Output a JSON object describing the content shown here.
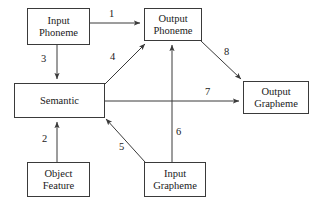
{
  "diagram": {
    "canvas": {
      "width": 325,
      "height": 204,
      "background": "#ffffff"
    },
    "stroke_color": "#3a3a3a",
    "text_color": "#1a1a1a",
    "nodes": [
      {
        "id": "input-phoneme",
        "line1": "Input",
        "line2": "Phoneme",
        "x": 27,
        "y": 8,
        "w": 63,
        "h": 37
      },
      {
        "id": "output-phoneme",
        "line1": "Output",
        "line2": "Phoneme",
        "x": 144,
        "y": 8,
        "w": 58,
        "h": 33
      },
      {
        "id": "semantic",
        "line1": "Semantic",
        "line2": "",
        "x": 14,
        "y": 83,
        "w": 91,
        "h": 35
      },
      {
        "id": "output-grapheme",
        "line1": "Output",
        "line2": "Grapheme",
        "x": 243,
        "y": 81,
        "w": 66,
        "h": 33
      },
      {
        "id": "object-feature",
        "line1": "Object",
        "line2": "Feature",
        "x": 27,
        "y": 162,
        "w": 63,
        "h": 35
      },
      {
        "id": "input-grapheme",
        "line1": "Input",
        "line2": "Grapheme",
        "x": 144,
        "y": 162,
        "w": 62,
        "h": 35
      }
    ],
    "edges": [
      {
        "id": "edge-1",
        "label": "1",
        "from": "input-phoneme",
        "to": "output-phoneme",
        "path": "M 90 23 L 140 23",
        "label_x": 109,
        "label_y": 9
      },
      {
        "id": "edge-3",
        "label": "3",
        "from": "input-phoneme",
        "to": "semantic",
        "path": "M 57 45 L 57 79",
        "label_x": 41,
        "label_y": 54
      },
      {
        "id": "edge-4",
        "label": "4",
        "from": "semantic",
        "to": "output-phoneme",
        "path": "M 105 84 L 145 44",
        "label_x": 110,
        "label_y": 52
      },
      {
        "id": "edge-8",
        "label": "8",
        "from": "output-phoneme",
        "to": "output-grapheme",
        "path": "M 201 41 L 241 79",
        "label_x": 224,
        "label_y": 47
      },
      {
        "id": "edge-7",
        "label": "7",
        "from": "semantic",
        "to": "output-grapheme",
        "path": "M 105 101 L 239 101",
        "label_x": 205,
        "label_y": 87
      },
      {
        "id": "edge-2",
        "label": "2",
        "from": "object-feature",
        "to": "semantic",
        "path": "M 57 162 L 57 122",
        "label_x": 42,
        "label_y": 134
      },
      {
        "id": "edge-5",
        "label": "5",
        "from": "input-grapheme",
        "to": "semantic",
        "path": "M 145 162 L 106 119",
        "label_x": 119,
        "label_y": 142
      },
      {
        "id": "edge-6",
        "label": "6",
        "from": "input-grapheme",
        "to": "output-phoneme",
        "path": "M 172 162 L 172 45",
        "label_x": 176,
        "label_y": 127
      }
    ]
  }
}
